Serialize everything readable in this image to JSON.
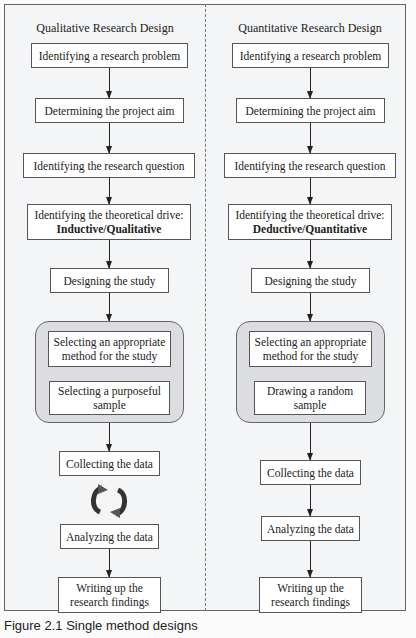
{
  "figure": {
    "caption": "Figure 2.1 Single method designs"
  },
  "qualitative": {
    "title": "Qualitative Research Design",
    "steps": {
      "s1": "Identifying a research problem",
      "s2": "Determining the project aim",
      "s3": "Identifying the research question",
      "s4a": "Identifying the theoretical drive:",
      "s4b": "Inductive/Qualitative",
      "s5": "Designing the study",
      "s6": "Selecting an appropriate method for the study",
      "s7": "Selecting a purposeful sample",
      "s8": "Collecting the data",
      "s9": "Analyzing the data",
      "s10": "Writing up the research findings"
    },
    "cycle_icon": "iterative-cycle-icon"
  },
  "quantitative": {
    "title": "Quantitative Research Design",
    "steps": {
      "s1": "Identifying a research problem",
      "s2": "Determining the project aim",
      "s3": "Identifying the research question",
      "s4a": "Identifying the theoretical drive:",
      "s4b": "Deductive/Quantitative",
      "s5": "Designing the study",
      "s6": "Selecting an appropriate method for the study",
      "s7": "Drawing a random sample",
      "s8": "Collecting the data",
      "s9": "Analyzing the data",
      "s10": "Writing up the research findings"
    }
  },
  "colors": {
    "group_fill": "#dcdde0",
    "frame_bg": "#f4f5f6",
    "border": "#555555"
  }
}
